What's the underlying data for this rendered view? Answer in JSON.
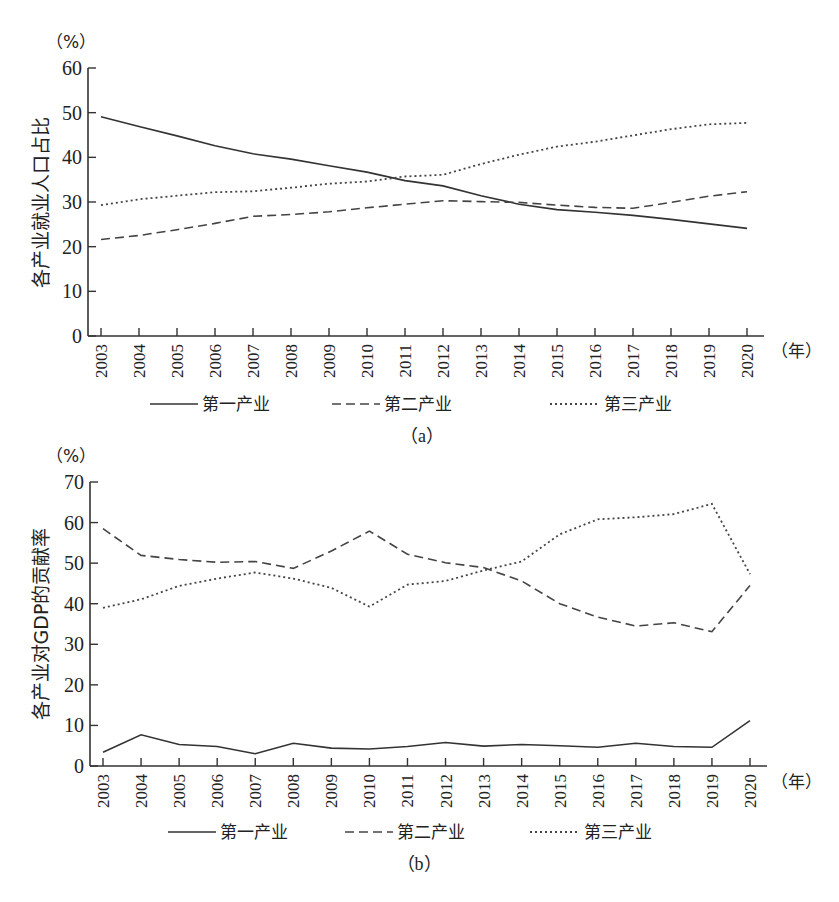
{
  "chart_data": [
    {
      "id": "a",
      "type": "line",
      "caption": "（a）",
      "title": "",
      "y_unit": "（%）",
      "x_unit": "（年）",
      "xlabel": "",
      "ylabel": "各产业就业人口占比",
      "ylim": [
        0,
        60
      ],
      "yticks": [
        0,
        10,
        20,
        30,
        40,
        50,
        60
      ],
      "grid": false,
      "legend_position": "bottom",
      "categories": [
        "2003",
        "2004",
        "2005",
        "2006",
        "2007",
        "2008",
        "2009",
        "2010",
        "2011",
        "2012",
        "2013",
        "2014",
        "2015",
        "2016",
        "2017",
        "2018",
        "2019",
        "2020"
      ],
      "series": [
        {
          "name": "第一产业",
          "style": "solid",
          "values": [
            49.1,
            46.9,
            44.8,
            42.6,
            40.8,
            39.6,
            38.1,
            36.7,
            34.8,
            33.6,
            31.4,
            29.5,
            28.3,
            27.7,
            27.0,
            26.1,
            25.1,
            24.1
          ]
        },
        {
          "name": "第二产业",
          "style": "dashed",
          "values": [
            21.6,
            22.5,
            23.8,
            25.2,
            26.8,
            27.2,
            27.8,
            28.7,
            29.5,
            30.3,
            30.1,
            29.9,
            29.3,
            28.8,
            28.6,
            29.9,
            31.3,
            32.3
          ]
        },
        {
          "name": "第三产业",
          "style": "dotted",
          "values": [
            29.3,
            30.6,
            31.4,
            32.2,
            32.4,
            33.2,
            34.1,
            34.6,
            35.7,
            36.1,
            38.5,
            40.6,
            42.4,
            43.5,
            44.9,
            46.3,
            47.4,
            47.7
          ]
        }
      ]
    },
    {
      "id": "b",
      "type": "line",
      "caption": "（b）",
      "title": "",
      "y_unit": "（%）",
      "x_unit": "（年）",
      "xlabel": "",
      "ylabel": "各产业对GDP的贡献率",
      "ylim": [
        0,
        70
      ],
      "yticks": [
        0,
        10,
        20,
        30,
        40,
        50,
        60,
        70
      ],
      "grid": false,
      "legend_position": "bottom",
      "categories": [
        "2003",
        "2004",
        "2005",
        "2006",
        "2007",
        "2008",
        "2009",
        "2010",
        "2011",
        "2012",
        "2013",
        "2014",
        "2015",
        "2016",
        "2017",
        "2018",
        "2019",
        "2020"
      ],
      "series": [
        {
          "name": "第一产业",
          "style": "solid",
          "values": [
            3.4,
            7.7,
            5.3,
            4.8,
            3.0,
            5.6,
            4.4,
            4.2,
            4.8,
            5.8,
            4.9,
            5.3,
            5.0,
            4.6,
            5.6,
            4.8,
            4.6,
            11.2
          ]
        },
        {
          "name": "第二产业",
          "style": "dashed",
          "values": [
            58.5,
            51.9,
            50.9,
            50.2,
            50.4,
            48.7,
            53.0,
            57.9,
            52.2,
            50.1,
            48.9,
            45.6,
            40.0,
            36.7,
            34.5,
            35.3,
            33.1,
            44.5
          ]
        },
        {
          "name": "第三产业",
          "style": "dotted",
          "values": [
            39.0,
            41.1,
            44.4,
            46.2,
            47.7,
            46.2,
            43.9,
            39.3,
            44.7,
            45.6,
            48.2,
            50.4,
            57.1,
            60.8,
            61.3,
            62.1,
            64.6,
            47.3
          ]
        }
      ]
    }
  ]
}
